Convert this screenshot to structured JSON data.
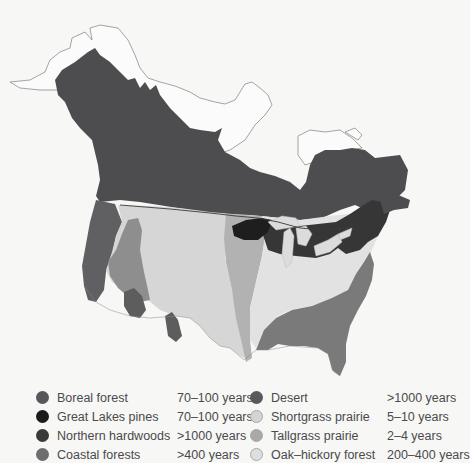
{
  "map": {
    "subject": "North America vegetation regions",
    "regions": [
      {
        "id": "boreal",
        "name": "Boreal forest",
        "color": "#4d4d4f"
      },
      {
        "id": "great-lakes",
        "name": "Great Lakes pines",
        "color": "#1e1e1f"
      },
      {
        "id": "northern-hardwoods",
        "name": "Northern hardwoods",
        "color": "#363637"
      },
      {
        "id": "coastal",
        "name": "Coastal forests",
        "color": "#6a6a6b"
      },
      {
        "id": "desert",
        "name": "Desert",
        "color": "#5d5d5e"
      },
      {
        "id": "shortgrass",
        "name": "Shortgrass prairie",
        "color": "#d6d6d6"
      },
      {
        "id": "tallgrass",
        "name": "Tallgrass prairie",
        "color": "#b2b2b2"
      },
      {
        "id": "oak-hickory",
        "name": "Oak–hickory forest",
        "color": "#e2e2e2"
      }
    ],
    "extra_colors": {
      "southeast_forest": "#7a7a7b",
      "great_basin": "#8e8e8f",
      "outline": "#555555",
      "water": "#f7f7f6"
    }
  },
  "legend": {
    "left": [
      {
        "label": "Boreal forest",
        "years": "70–100 years",
        "color": "#58585a"
      },
      {
        "label": "Great Lakes pines",
        "years": "70–100 years",
        "color": "#1c1c1d"
      },
      {
        "label": "Northern hardwoods",
        "years": ">1000 years",
        "color": "#3a3a3b"
      },
      {
        "label": "Coastal forests",
        "years": ">400 years",
        "color": "#6d6d6e"
      }
    ],
    "right": [
      {
        "label": "Desert",
        "years": ">1000 years",
        "color": "#5a5a5b"
      },
      {
        "label": "Shortgrass prairie",
        "years": "5–10 years",
        "color": "#d4d4d4"
      },
      {
        "label": "Tallgrass prairie",
        "years": "2–4 years",
        "color": "#a9a9a9"
      },
      {
        "label": "Oak–hickory forest",
        "years": "200–400 years",
        "color": "#dedede"
      }
    ]
  }
}
